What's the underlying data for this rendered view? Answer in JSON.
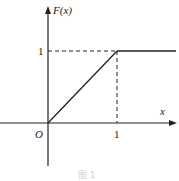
{
  "diagram": {
    "type": "cdf_plot",
    "function_label": "F(x)",
    "x_axis_label": "x",
    "origin_label": "O",
    "x_tick_label": "1",
    "y_tick_label": "1",
    "caption": "图 1",
    "segments": [
      {
        "from": [
          0,
          0
        ],
        "to": [
          1,
          1
        ],
        "style": "solid"
      },
      {
        "from": [
          1,
          1
        ],
        "to": [
          "+inf",
          1
        ],
        "style": "solid"
      },
      {
        "from": [
          0,
          1
        ],
        "to": [
          1,
          1
        ],
        "style": "dashed"
      },
      {
        "from": [
          1,
          0
        ],
        "to": [
          1,
          1
        ],
        "style": "dashed"
      }
    ],
    "colors": {
      "line": "#222222",
      "caption": "#cfcfcf"
    }
  }
}
